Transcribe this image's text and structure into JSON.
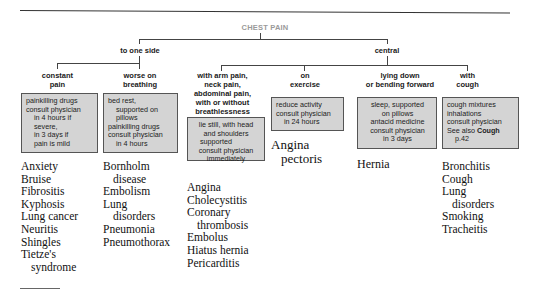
{
  "diagram": {
    "title": "CHEST PAIN",
    "branches": {
      "to_one_side": "to one side",
      "central": "central"
    },
    "categories": [
      {
        "id": "constant-pain",
        "label_lines": [
          "constant",
          "pain"
        ],
        "advice": [
          "painkilling drugs",
          "consult physician",
          "in 4 hours if",
          "severe,",
          "in 3 days if",
          "pain is mild"
        ],
        "conditions": [
          "Anxiety",
          "Bruise",
          "Fibrositis",
          "Kyphosis",
          "Lung cancer",
          "Neuritis",
          "Shingles",
          "Tietze's",
          "syndrome"
        ]
      },
      {
        "id": "worse-on-breathing",
        "label_lines": [
          "worse on",
          "breathing"
        ],
        "advice": [
          "bed rest,",
          "supported on",
          "pillows",
          "painkilling drugs",
          "consult physician",
          "in 4 hours"
        ],
        "conditions": [
          "Bornholm",
          "disease",
          "Embolism",
          "Lung",
          "disorders",
          "Pneumonia",
          "Pneumothorax"
        ]
      },
      {
        "id": "arm-neck-abdominal-pain",
        "label_lines": [
          "with arm pain,",
          "neck pain,",
          "abdominal pain,",
          "with or without",
          "breathlessness"
        ],
        "advice": [
          "lie still, with head",
          "and shoulders",
          "supported",
          "consult physician",
          "immediately"
        ],
        "conditions": [
          "Angina",
          "Cholecystitis",
          "Coronary",
          "thrombosis",
          "Embolus",
          "Hiatus hernia",
          "Pericarditis"
        ]
      },
      {
        "id": "on-exercise",
        "label_lines": [
          "on",
          "exercise"
        ],
        "advice": [
          "reduce activity",
          "consult physician",
          "in 24 hours"
        ],
        "conditions": [
          "Angina",
          "pectoris"
        ]
      },
      {
        "id": "lying-down",
        "label_lines": [
          "lying down",
          "or bending forward"
        ],
        "advice": [
          "sleep, supported",
          "on pillows",
          "antacid medicine",
          "consult physician",
          "in 3 days"
        ],
        "conditions": [
          "Hernia"
        ]
      },
      {
        "id": "with-cough",
        "label_lines": [
          "with",
          "cough"
        ],
        "advice": [
          "cough mixtures",
          "inhalations",
          "consult physician",
          "See also",
          "Cough",
          "p.42"
        ],
        "conditions": [
          "Bronchitis",
          "Cough",
          "Lung",
          "disorders",
          "Smoking",
          "Tracheitis"
        ]
      }
    ]
  }
}
